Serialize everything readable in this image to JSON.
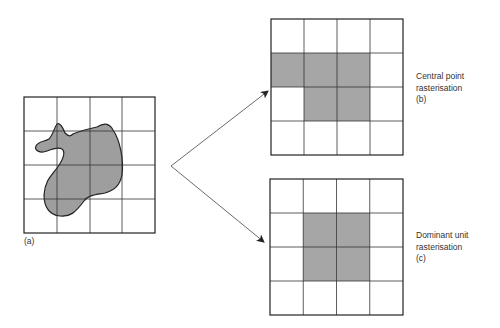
{
  "figure": {
    "source_grid": {
      "label": "(a)"
    },
    "central_point": {
      "title_line1": "Central point",
      "title_line2": "rasterisation",
      "tag": "(b)",
      "shaded_cells": [
        [
          1,
          0
        ],
        [
          1,
          1
        ],
        [
          1,
          2
        ],
        [
          2,
          1
        ],
        [
          2,
          2
        ]
      ]
    },
    "dominant_unit": {
      "title_line1": "Dominant unit",
      "title_line2": "rasterisation",
      "tag": "(c)",
      "shaded_cells": [
        [
          1,
          1
        ],
        [
          1,
          2
        ],
        [
          2,
          1
        ],
        [
          2,
          2
        ]
      ]
    },
    "grid_size": 4,
    "colors": {
      "shade": "#a6a6a6",
      "line": "#333333",
      "blob_fill": "#9e9e9e"
    }
  }
}
